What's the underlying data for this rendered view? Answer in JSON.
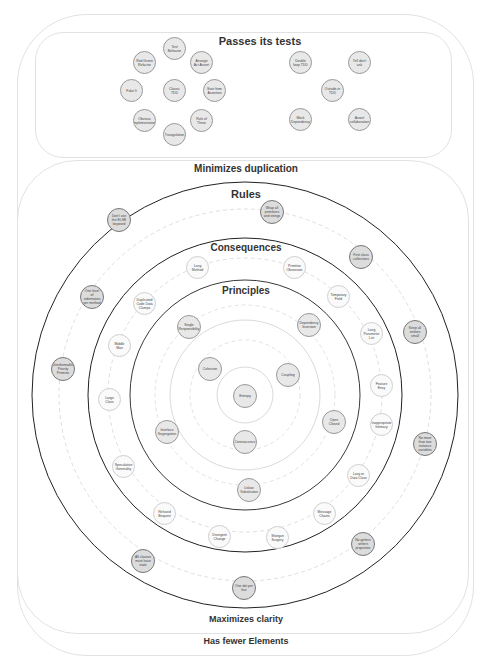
{
  "labels": {
    "passes_tests": "Passes its tests",
    "minimizes_duplication": "Minimizes duplication",
    "maximizes_clarity": "Maximizes clarity",
    "has_fewer_elements": "Has fewer Elements",
    "rules": "Rules",
    "consequences": "Consequences",
    "principles": "Principles"
  },
  "tests_group_left": [
    {
      "label": "Test Behavior"
    },
    {
      "label": "Red Green Refactor"
    },
    {
      "label": "Arrange Act Assert"
    },
    {
      "label": "Fake It"
    },
    {
      "label": "Classic TDD"
    },
    {
      "label": "Start from Assertion"
    },
    {
      "label": "Obvious implementation"
    },
    {
      "label": "Rule of Three"
    },
    {
      "label": "Triangulation"
    }
  ],
  "tests_group_right": [
    {
      "label": "Double loop TDD"
    },
    {
      "label": "Tell don't ask"
    },
    {
      "label": "Outside-in TDD"
    },
    {
      "label": "Mock Dependency"
    },
    {
      "label": "Assert collaboration"
    }
  ],
  "rules": [
    {
      "label": "Don't use the ELSE keyword"
    },
    {
      "label": "Wrap all primitives and strings"
    },
    {
      "label": "First class collections"
    },
    {
      "label": "One level of indentation per method"
    },
    {
      "label": "Keep all entities small"
    },
    {
      "label": "Unreformable Priority Premise"
    },
    {
      "label": "No more than two instance variables"
    },
    {
      "label": "All classes must have state"
    },
    {
      "label": "No getters setters properties"
    },
    {
      "label": "One dot per line"
    }
  ],
  "consequences": [
    {
      "label": "Long Method"
    },
    {
      "label": "Primitive Obsession"
    },
    {
      "label": "Duplicated Code Data Clumps"
    },
    {
      "label": "Temporary Field"
    },
    {
      "label": "Middle Man"
    },
    {
      "label": "Long Parameter List"
    },
    {
      "label": "Large Class"
    },
    {
      "label": "Feature Envy"
    },
    {
      "label": "Inappropriate Intimacy"
    },
    {
      "label": "Speculative Generality"
    },
    {
      "label": "Lazy or Data Class"
    },
    {
      "label": "Refused Bequest"
    },
    {
      "label": "Message Chains"
    },
    {
      "label": "Divergent Change"
    },
    {
      "label": "Shotgun Surgery"
    }
  ],
  "principles": [
    {
      "label": "Single Responsibility"
    },
    {
      "label": "Dependency Inversion"
    },
    {
      "label": "Open Closed"
    },
    {
      "label": "Interface Segregation"
    },
    {
      "label": "Liskov Substitution"
    }
  ],
  "core": [
    {
      "label": "Cohesion"
    },
    {
      "label": "Coupling"
    },
    {
      "label": "Connascence"
    },
    {
      "label": "Entropy"
    }
  ]
}
